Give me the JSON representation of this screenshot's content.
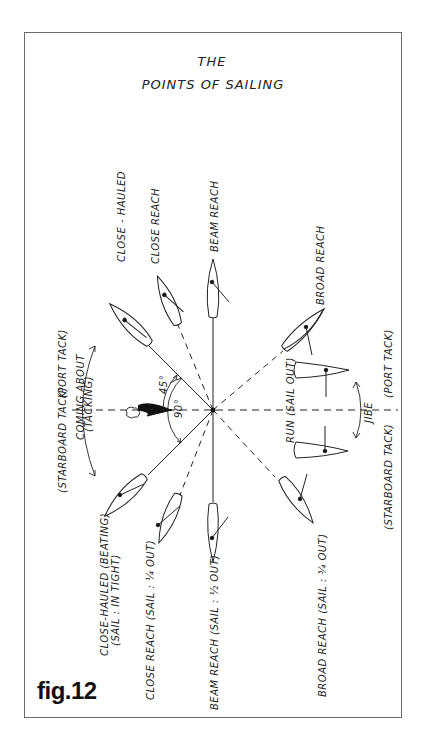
{
  "figure": {
    "title_line1": "THE",
    "title_line2": "POINTS   OF SAILING",
    "caption": "fig.12"
  },
  "labels": {
    "close_hauled_upper": "CLOSE - HAULED",
    "close_reach_upper": "CLOSE REACH",
    "beam_reach_upper": "BEAM REACH",
    "broad_reach_upper": "BROAD REACH",
    "port_tack_left": "(PORT TACK)",
    "starboard_tack_left": "(STARBOARD TACK)",
    "coming_about": "COMING ABOUT",
    "tacking": "(TACKING)",
    "angle_45": "45°",
    "angle_90": "90°",
    "run": "RUN (SAIL OUT)",
    "jibe": "JIBE",
    "starboard_tack_right": "(STARBOARD TACK)",
    "port_tack_right": "(PORT TACK)",
    "close_hauled_lower": "CLOSE-HAULED (BEATING)",
    "close_hauled_lower_sub": "(SAIL : IN TIGHT)",
    "close_reach_lower": "CLOSE REACH (SAIL : ¼ OUT)",
    "beam_reach_lower": "BEAM REACH (SAIL : ½ OUT)",
    "broad_reach_lower": "BROAD REACH (SAIL : ¾ OUT)"
  },
  "icons": {
    "wind": "wind-arrow-icon",
    "cloud": "cloud-icon",
    "boat": "sailboat-hull-icon"
  },
  "colors": {
    "ink": "#222222",
    "frame": "#6b6b6b",
    "background": "#ffffff"
  }
}
